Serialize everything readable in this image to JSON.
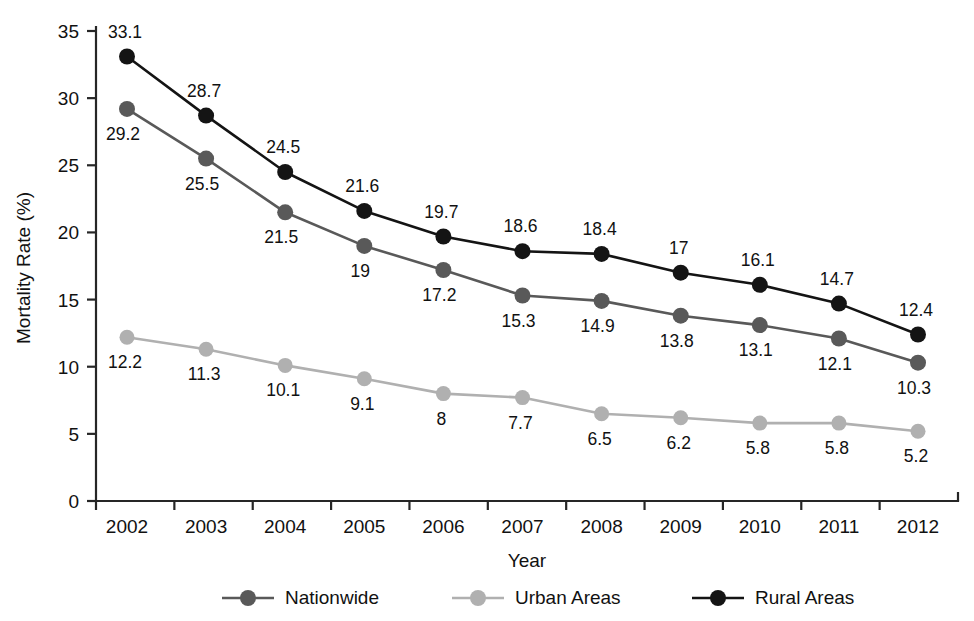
{
  "chart_data": {
    "type": "line",
    "title": "",
    "xlabel": "Year",
    "ylabel": "Mortality Rate (%)",
    "categories": [
      "2002",
      "2003",
      "2004",
      "2005",
      "2006",
      "2007",
      "2008",
      "2009",
      "2010",
      "2011",
      "2012"
    ],
    "ylim": [
      0,
      35
    ],
    "yticks": [
      "0",
      "5",
      "10",
      "15",
      "20",
      "25",
      "30",
      "35"
    ],
    "grid": false,
    "legend_position": "bottom",
    "series": [
      {
        "name": "Nationwide",
        "color": "#595959",
        "values": [
          29.2,
          25.5,
          21.5,
          19,
          17.2,
          15.3,
          14.9,
          13.8,
          13.1,
          12.1,
          10.3
        ],
        "labels": [
          "29.2",
          "25.5",
          "21.5",
          "19",
          "17.2",
          "15.3",
          "14.9",
          "13.8",
          "13.1",
          "12.1",
          "10.3"
        ]
      },
      {
        "name": "Urban Areas",
        "color": "#b0b0b0",
        "values": [
          12.2,
          11.3,
          10.1,
          9.1,
          8,
          7.7,
          6.5,
          6.2,
          5.8,
          5.8,
          5.2
        ],
        "labels": [
          "12.2",
          "11.3",
          "10.1",
          "9.1",
          "8",
          "7.7",
          "6.5",
          "6.2",
          "5.8",
          "5.8",
          "5.2"
        ]
      },
      {
        "name": "Rural Areas",
        "color": "#141414",
        "values": [
          33.1,
          28.7,
          24.5,
          21.6,
          19.7,
          18.6,
          18.4,
          17,
          16.1,
          14.7,
          12.4
        ],
        "labels": [
          "33.1",
          "28.7",
          "24.5",
          "21.6",
          "19.7",
          "18.6",
          "18.4",
          "17",
          "16.1",
          "14.7",
          "12.4"
        ]
      }
    ]
  },
  "legend": {
    "items": [
      {
        "label": "Nationwide",
        "color": "#595959"
      },
      {
        "label": "Urban Areas",
        "color": "#b0b0b0"
      },
      {
        "label": "Rural Areas",
        "color": "#141414"
      }
    ]
  },
  "axes": {
    "x_title": "Year",
    "y_title": "Mortality Rate (%)"
  }
}
